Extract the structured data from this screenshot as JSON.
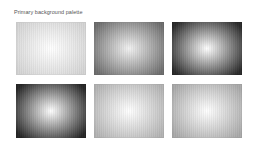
{
  "header": {
    "title": "Primary background palette"
  },
  "palette": {
    "swatches": [
      {
        "index": 1,
        "center_color": "#ffffff",
        "edge_color": "#d4d4d4",
        "style": "radial-gradient"
      },
      {
        "index": 2,
        "center_color": "#f2f2f2",
        "edge_color": "#6e6e6e",
        "style": "radial-gradient"
      },
      {
        "index": 3,
        "center_color": "#ffffff",
        "edge_color": "#2a2a2a",
        "style": "radial-gradient"
      },
      {
        "index": 4,
        "center_color": "#ffffff",
        "edge_color": "#262626",
        "style": "radial-gradient"
      },
      {
        "index": 5,
        "center_color": "#ffffff",
        "edge_color": "#b3b3b3",
        "style": "radial-gradient"
      },
      {
        "index": 6,
        "center_color": "#ffffff",
        "edge_color": "#a9a9a9",
        "style": "radial-gradient"
      }
    ]
  }
}
